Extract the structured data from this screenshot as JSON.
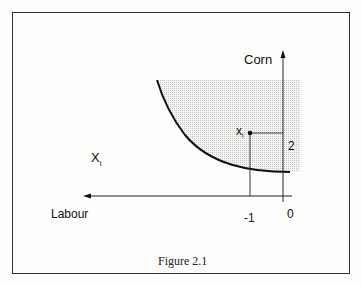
{
  "figure": {
    "caption": "Figure 2.1",
    "y_axis_label": "Corn",
    "x_axis_label": "Labour",
    "set_label": "X",
    "set_subscript": "i",
    "point_label": "x",
    "point_subscript": "i",
    "tick_x": "-1",
    "tick_y": "2",
    "origin": "0"
  }
}
